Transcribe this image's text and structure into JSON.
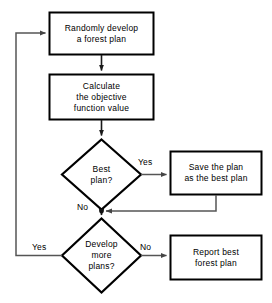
{
  "diagram": {
    "background_color": "#ffffff",
    "stroke_color": "#000000",
    "connector_color": "#555555",
    "nodes": [
      {
        "id": "random-plan",
        "shape": "process",
        "lines": [
          "Randomly develop",
          "a forest plan"
        ],
        "text": "Randomly develop\na forest plan"
      },
      {
        "id": "calculate-objective",
        "shape": "process",
        "lines": [
          "Calculate",
          "the objective",
          "function value"
        ],
        "text": "Calculate\nthe objective\nfunction value"
      },
      {
        "id": "best-plan-decision",
        "shape": "decision",
        "lines": [
          "Best",
          "plan?"
        ],
        "text": "Best\nplan?"
      },
      {
        "id": "save-best-plan",
        "shape": "process",
        "lines": [
          "Save the plan",
          "as the best plan"
        ],
        "text": "Save the plan\nas the best plan"
      },
      {
        "id": "develop-more-decision",
        "shape": "decision",
        "lines": [
          "Develop",
          "more",
          "plans?"
        ],
        "text": "Develop\nmore\nplans?"
      },
      {
        "id": "report-best-plan",
        "shape": "process",
        "lines": [
          "Report best",
          "forest plan"
        ],
        "text": "Report best\nforest plan"
      }
    ],
    "edge_labels": {
      "best_plan_yes": "Yes",
      "best_plan_no": "No",
      "develop_more_no": "No",
      "develop_more_yes": "Yes"
    }
  }
}
